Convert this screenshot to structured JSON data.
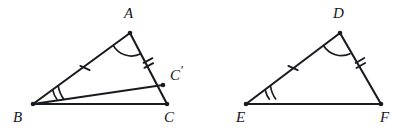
{
  "figure": {
    "background_color": "#ffffff",
    "stroke_color": "#1a1b20",
    "label_color": "#15161a"
  },
  "labels": {
    "A": "A",
    "B": "B",
    "C": "C",
    "C_prime_base": "C",
    "C_prime_mark": "′",
    "D": "D",
    "E": "E",
    "F": "F"
  },
  "left_triangle": {
    "name": "triangle-abc",
    "vertices": {
      "A": {
        "x": 130,
        "y": 33
      },
      "B": {
        "x": 33,
        "y": 104
      },
      "C": {
        "x": 167,
        "y": 104
      },
      "C_prime": {
        "x": 163,
        "y": 85
      }
    },
    "label_positions": {
      "A": {
        "x": 124,
        "y": 6
      },
      "B": {
        "x": 13,
        "y": 110
      },
      "C": {
        "x": 164,
        "y": 110
      },
      "C_prime": {
        "x": 170,
        "y": 63
      }
    },
    "edges": [
      {
        "name": "segment-ab",
        "from": "B",
        "to": "A"
      },
      {
        "name": "segment-ac",
        "from": "A",
        "to": "C"
      },
      {
        "name": "segment-bc",
        "from": "B",
        "to": "C"
      },
      {
        "name": "segment-bc-prime",
        "from": "B",
        "to": "C_prime"
      }
    ],
    "tick_marks": [
      {
        "name": "tick-single-ab",
        "count": 1,
        "on_edge": "segment-ab",
        "x": 85,
        "y": 68
      },
      {
        "name": "tick-double-ac-prime",
        "count": 2,
        "on_edge": "segment-ac",
        "x": 148,
        "y": 63
      }
    ],
    "angle_arcs": [
      {
        "name": "angle-arc-a",
        "at_vertex": "A",
        "count": 1
      },
      {
        "name": "angle-arc-b",
        "at_vertex": "B",
        "count": 2
      }
    ]
  },
  "right_triangle": {
    "name": "triangle-def",
    "vertices": {
      "D": {
        "x": 340,
        "y": 33
      },
      "E": {
        "x": 246,
        "y": 104
      },
      "F": {
        "x": 381,
        "y": 104
      }
    },
    "label_positions": {
      "D": {
        "x": 333,
        "y": 6
      },
      "E": {
        "x": 236,
        "y": 110
      },
      "F": {
        "x": 380,
        "y": 110
      }
    },
    "edges": [
      {
        "name": "segment-ed",
        "from": "E",
        "to": "D"
      },
      {
        "name": "segment-df",
        "from": "D",
        "to": "F"
      },
      {
        "name": "segment-ef",
        "from": "E",
        "to": "F"
      }
    ],
    "tick_marks": [
      {
        "name": "tick-single-ed",
        "count": 1,
        "on_edge": "segment-ed",
        "x": 293,
        "y": 68
      },
      {
        "name": "tick-double-df",
        "count": 2,
        "on_edge": "segment-df",
        "x": 360,
        "y": 63
      }
    ],
    "angle_arcs": [
      {
        "name": "angle-arc-d",
        "at_vertex": "D",
        "count": 1
      },
      {
        "name": "angle-arc-e",
        "at_vertex": "E",
        "count": 2
      }
    ]
  }
}
